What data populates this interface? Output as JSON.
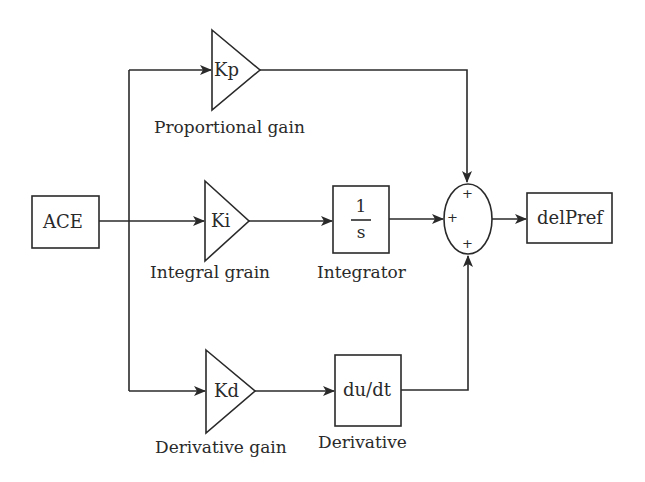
{
  "diagram": {
    "type": "PID controller block diagram",
    "input_block": {
      "label": "ACE"
    },
    "output_block": {
      "label": "delPref"
    },
    "gains": [
      {
        "id": "kp",
        "symbol": "Kp",
        "caption": "Proportional gain"
      },
      {
        "id": "ki",
        "symbol": "Ki",
        "caption": "Integral grain"
      },
      {
        "id": "kd",
        "symbol": "Kd",
        "caption": "Derivative gain"
      }
    ],
    "integrator": {
      "numerator": "1",
      "denominator": "s",
      "caption": "Integrator"
    },
    "derivative": {
      "label": "du/dt",
      "caption": "Derivative"
    },
    "summing_junction": {
      "signs": [
        "+",
        "+",
        "+"
      ]
    },
    "colors": {
      "stroke": "#2a2a2a",
      "background": "#ffffff"
    }
  }
}
